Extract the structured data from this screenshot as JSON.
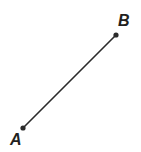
{
  "figure": {
    "width": 141,
    "height": 152,
    "background_color": "#ffffff",
    "stroke_color": "#2b2b2b",
    "label_color": "#231f20",
    "line_width": 1.6,
    "point_radius": 2.6
  },
  "chart_data": {
    "type": "scatter",
    "xlabel": "",
    "ylabel": "",
    "grid": false,
    "legend": null,
    "xlim": [
      0,
      141
    ],
    "ylim": [
      0,
      152
    ],
    "points": [
      {
        "name": "A",
        "label": "A",
        "x": 23,
        "y": 128,
        "label_x": 10,
        "label_y": 140
      },
      {
        "name": "B",
        "label": "B",
        "x": 116,
        "y": 35,
        "label_x": 125,
        "label_y": 21
      }
    ],
    "segments": [
      {
        "name": "AB",
        "from": "A",
        "to": "B",
        "x1": 23,
        "y1": 128,
        "x2": 116,
        "y2": 35
      }
    ]
  },
  "labels": {
    "point_a": "A",
    "point_b": "B"
  }
}
